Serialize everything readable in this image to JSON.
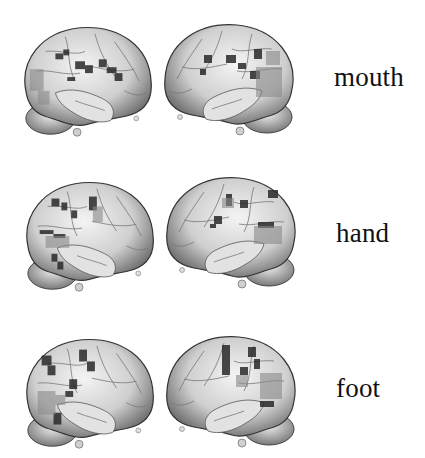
{
  "figure": {
    "rows": [
      {
        "label": "mouth",
        "views": [
          "left-lateral",
          "right-lateral"
        ]
      },
      {
        "label": "hand",
        "views": [
          "left-lateral",
          "right-lateral"
        ]
      },
      {
        "label": "foot",
        "views": [
          "left-lateral",
          "right-lateral"
        ]
      }
    ],
    "colors": {
      "background": "#ffffff",
      "cortex": "#d9d9d9",
      "activation": "#2a2a2a",
      "outline": "#333333"
    }
  }
}
